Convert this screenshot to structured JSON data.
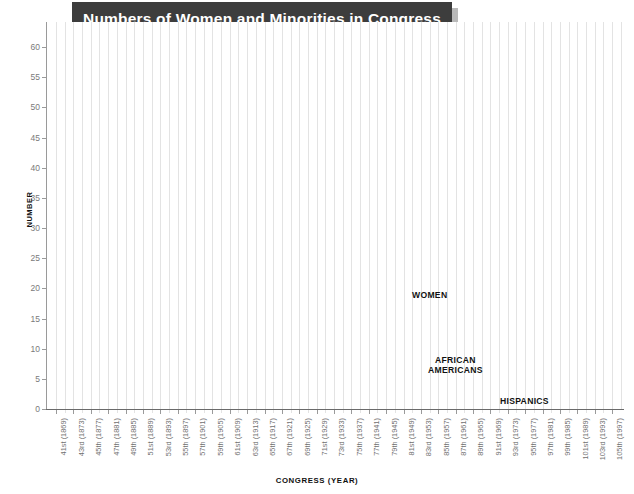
{
  "title": "Numbers of Women and Minorities in Congress",
  "axis": {
    "ylabel": "NUMBER",
    "xlabel": "CONGRESS (YEAR)"
  },
  "series_labels": {
    "women": "WOMEN",
    "african_americans": "AFRICAN\nAMERICANS",
    "african_americans_line1": "AFRICAN",
    "african_americans_line2": "AMERICANS",
    "hispanics": "HISPANICS"
  },
  "colors": {
    "women": "#4a4a4a",
    "african_americans": "#8a8a8a",
    "hispanics": "#c9c9c9",
    "banner": "#3d3d3d",
    "banner_shadow": "#b9b9b9",
    "gridline": "#e3e3e3",
    "axis": "#9a9a9a",
    "tick_text": "#7a7a7a"
  },
  "chart_data": {
    "type": "line",
    "title": "Numbers of Women and Minorities in Congress",
    "xlabel": "CONGRESS (YEAR)",
    "ylabel": "NUMBER",
    "ylim": [
      0,
      62
    ],
    "yticks": [
      0,
      5,
      10,
      15,
      20,
      25,
      30,
      35,
      40,
      45,
      50,
      55,
      60
    ],
    "grid": "vertical-only",
    "legend": "inline-annotations",
    "categories": [
      "41st (1869)",
      "43rd (1873)",
      "45th (1877)",
      "47th (1881)",
      "49th (1885)",
      "51st (1889)",
      "53rd (1893)",
      "55th (1897)",
      "57th (1901)",
      "59th (1905)",
      "61st (1909)",
      "63rd (1913)",
      "65th (1917)",
      "67th (1921)",
      "69th (1925)",
      "71st (1929)",
      "73rd (1933)",
      "75th (1937)",
      "77th (1941)",
      "79th (1945)",
      "81st (1949)",
      "83rd (1953)",
      "85th (1957)",
      "87th (1961)",
      "89th (1965)",
      "91st (1969)",
      "93rd (1973)",
      "95th (1977)",
      "97th (1981)",
      "99th (1985)",
      "101st (1989)",
      "103rd (1993)",
      "105th (1997)"
    ],
    "series": [
      {
        "name": "WOMEN",
        "color": "#4a4a4a",
        "values": [
          0,
          0,
          0,
          0,
          0,
          0,
          0,
          0,
          0,
          0,
          0,
          0,
          1,
          3,
          3,
          9,
          8,
          8,
          10,
          11,
          10,
          15,
          17,
          20,
          13,
          11,
          16,
          18,
          21,
          25,
          29,
          54,
          57
        ]
      },
      {
        "name": "AFRICAN AMERICANS",
        "color": "#8a8a8a",
        "values": [
          2,
          5,
          8,
          2,
          2,
          3,
          1,
          1,
          0,
          0,
          0,
          0,
          0,
          1,
          1,
          1,
          1,
          1,
          1,
          2,
          2,
          3,
          4,
          5,
          6,
          10,
          16,
          17,
          18,
          21,
          24,
          39,
          37
        ]
      },
      {
        "name": "HISPANICS",
        "color": "#c9c9c9",
        "values": [
          0,
          0,
          0,
          0,
          0,
          0,
          0,
          0,
          0,
          0,
          0,
          0,
          0,
          0,
          0,
          0,
          0,
          1,
          1,
          1,
          1,
          1,
          1,
          2,
          3,
          4,
          5,
          5,
          6,
          11,
          11,
          17,
          17
        ]
      }
    ]
  }
}
